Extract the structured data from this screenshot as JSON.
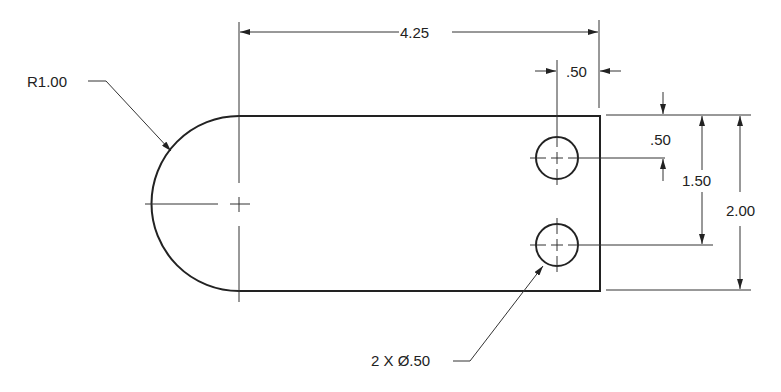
{
  "drawing": {
    "dimensions": {
      "overall_length": "4.25",
      "radius": "R1.00",
      "hole_edge_offset": ".50",
      "hole_top_offset": ".50",
      "hole_spacing": "1.50",
      "overall_height": "2.00",
      "holes_callout": "2 X Ø.50"
    }
  }
}
